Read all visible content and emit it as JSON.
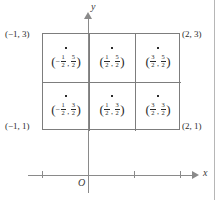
{
  "figure": {
    "type": "coordinate-grid-diagram",
    "axes": {
      "x_label": "x",
      "y_label": "y",
      "origin_label": "O",
      "x_ticks": [
        "-1",
        "1",
        "2"
      ],
      "y_ticks": []
    },
    "corner_labels": {
      "top_left": "(−1, 3)",
      "top_right": "(2, 3)",
      "bottom_left": "(−1, 1)",
      "bottom_right": "(2, 1)"
    },
    "region": {
      "x_range": [
        -1,
        2
      ],
      "y_range": [
        1,
        3
      ],
      "columns": 3,
      "rows": 2
    },
    "cells": [
      {
        "row": 0,
        "col": 0,
        "marker": "dot",
        "x_sign": "−",
        "x_num": "1",
        "x_den": "2",
        "y_num": "5",
        "y_den": "2",
        "open": "(",
        "sep": ",",
        "close": ")"
      },
      {
        "row": 0,
        "col": 1,
        "marker": "dot",
        "x_sign": "",
        "x_num": "1",
        "x_den": "2",
        "y_num": "5",
        "y_den": "2",
        "open": "(",
        "sep": ",",
        "close": ")"
      },
      {
        "row": 0,
        "col": 2,
        "marker": "dot",
        "x_sign": "",
        "x_num": "3",
        "x_den": "2",
        "y_num": "5",
        "y_den": "2",
        "open": "(",
        "sep": ",",
        "close": ")"
      },
      {
        "row": 1,
        "col": 0,
        "marker": "dot",
        "x_sign": "−",
        "x_num": "1",
        "x_den": "2",
        "y_num": "3",
        "y_den": "2",
        "open": "(",
        "sep": ",",
        "close": ")"
      },
      {
        "row": 1,
        "col": 1,
        "marker": "dot",
        "x_sign": "",
        "x_num": "1",
        "x_den": "2",
        "y_num": "3",
        "y_den": "2",
        "open": "(",
        "sep": ",",
        "close": ")"
      },
      {
        "row": 1,
        "col": 2,
        "marker": "dot",
        "x_sign": "",
        "x_num": "3",
        "x_den": "2",
        "y_num": "3",
        "y_den": "2",
        "open": "(",
        "sep": ",",
        "close": ")"
      }
    ],
    "colors": {
      "axis": "#8a8a8a",
      "grid": "#7d7d7d",
      "text": "#2b2b2b",
      "page_border": "#b6b6b6"
    }
  }
}
